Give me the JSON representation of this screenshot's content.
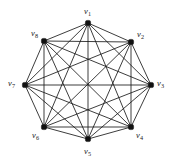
{
  "figure": {
    "kind": "graph-diagram",
    "title": "",
    "caption": "",
    "background_color": "#ffffff",
    "line_color": "#1a1a1a",
    "node_color": "#111111",
    "label_color": "#1a1a1a",
    "width": 177,
    "height": 164
  },
  "chart_data": {
    "type": "diagram",
    "graph_name": "K8 complete graph",
    "layout": "regular-octagon",
    "center": {
      "x": 88,
      "y": 84
    },
    "radius": 61,
    "node_count": 8,
    "edge_count": 28,
    "nodes": [
      {
        "id": "v1",
        "label": "v",
        "subscript": "1",
        "x": 88,
        "y": 23,
        "label_x": 84,
        "label_y": 7,
        "label_align": "center"
      },
      {
        "id": "v2",
        "label": "v",
        "subscript": "2",
        "x": 131,
        "y": 42,
        "label_x": 137,
        "label_y": 30,
        "label_align": "left"
      },
      {
        "id": "v3",
        "label": "v",
        "subscript": "3",
        "x": 151,
        "y": 85,
        "label_x": 157,
        "label_y": 79,
        "label_align": "left"
      },
      {
        "id": "v4",
        "label": "v",
        "subscript": "4",
        "x": 131,
        "y": 127,
        "label_x": 136,
        "label_y": 131,
        "label_align": "left"
      },
      {
        "id": "v5",
        "label": "v",
        "subscript": "5",
        "x": 88,
        "y": 139,
        "label_x": 84,
        "label_y": 147,
        "label_align": "center"
      },
      {
        "id": "v6",
        "label": "v",
        "subscript": "6",
        "x": 44,
        "y": 127,
        "label_x": 32,
        "label_y": 131,
        "label_align": "left"
      },
      {
        "id": "v7",
        "label": "v",
        "subscript": "7",
        "x": 25,
        "y": 85,
        "label_x": 8,
        "label_y": 79,
        "label_align": "left"
      },
      {
        "id": "v8",
        "label": "v",
        "subscript": "8",
        "x": 44,
        "y": 41,
        "label_x": 31,
        "label_y": 29,
        "label_align": "left"
      }
    ],
    "edges": [
      [
        "v1",
        "v2"
      ],
      [
        "v1",
        "v3"
      ],
      [
        "v1",
        "v4"
      ],
      [
        "v1",
        "v5"
      ],
      [
        "v1",
        "v6"
      ],
      [
        "v1",
        "v7"
      ],
      [
        "v1",
        "v8"
      ],
      [
        "v2",
        "v3"
      ],
      [
        "v2",
        "v4"
      ],
      [
        "v2",
        "v5"
      ],
      [
        "v2",
        "v6"
      ],
      [
        "v2",
        "v7"
      ],
      [
        "v2",
        "v8"
      ],
      [
        "v3",
        "v4"
      ],
      [
        "v3",
        "v5"
      ],
      [
        "v3",
        "v6"
      ],
      [
        "v3",
        "v7"
      ],
      [
        "v3",
        "v8"
      ],
      [
        "v4",
        "v5"
      ],
      [
        "v4",
        "v6"
      ],
      [
        "v4",
        "v7"
      ],
      [
        "v4",
        "v8"
      ],
      [
        "v5",
        "v6"
      ],
      [
        "v5",
        "v7"
      ],
      [
        "v5",
        "v8"
      ],
      [
        "v6",
        "v7"
      ],
      [
        "v6",
        "v8"
      ],
      [
        "v7",
        "v8"
      ]
    ]
  }
}
